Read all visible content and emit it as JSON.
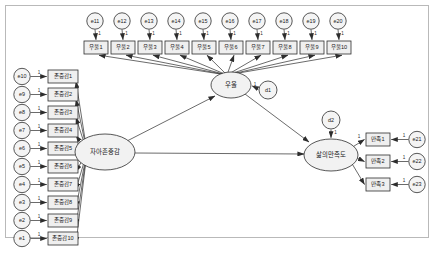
{
  "diagram": {
    "caption": "",
    "colors": {
      "frame_border": "#b9b9b9",
      "node_fill": "#f1f1f1",
      "node_stroke": "#2d2d2d",
      "edge": "#3a3a3a",
      "background": "#ffffff"
    },
    "latents": [
      {
        "id": "self_esteem",
        "label": "자아존중감",
        "cx": 105,
        "cy": 152,
        "rx": 30,
        "ry": 18
      },
      {
        "id": "depression",
        "label": "우울",
        "cx": 231,
        "cy": 85,
        "rx": 20,
        "ry": 13
      },
      {
        "id": "life_satis",
        "label": "삶의만족도",
        "cx": 331,
        "cy": 155,
        "rx": 27,
        "ry": 16
      }
    ],
    "disturbances": [
      {
        "id": "d1",
        "label": "d1",
        "cx": 268,
        "cy": 90,
        "r": 9
      },
      {
        "id": "d2",
        "label": "d2",
        "cx": 331,
        "cy": 120,
        "r": 9
      }
    ],
    "depression_indicators": {
      "boxes": [
        {
          "label": "우울1",
          "x": 84,
          "y": 41
        },
        {
          "label": "우울2",
          "x": 111,
          "y": 41
        },
        {
          "label": "우울3",
          "x": 138,
          "y": 41
        },
        {
          "label": "우울4",
          "x": 165,
          "y": 41
        },
        {
          "label": "우울5",
          "x": 192,
          "y": 41
        },
        {
          "label": "우울6",
          "x": 219,
          "y": 41
        },
        {
          "label": "우울7",
          "x": 246,
          "y": 41
        },
        {
          "label": "우울8",
          "x": 273,
          "y": 41
        },
        {
          "label": "우울9",
          "x": 300,
          "y": 41
        },
        {
          "label": "우울10",
          "x": 327,
          "y": 41
        }
      ],
      "errors": [
        {
          "label": "e11",
          "cx": 95,
          "cy": 21
        },
        {
          "label": "e12",
          "cx": 122,
          "cy": 21
        },
        {
          "label": "e13",
          "cx": 149,
          "cy": 21
        },
        {
          "label": "e14",
          "cx": 176,
          "cy": 21
        },
        {
          "label": "e15",
          "cx": 203,
          "cy": 21
        },
        {
          "label": "e16",
          "cx": 230,
          "cy": 21
        },
        {
          "label": "e17",
          "cx": 257,
          "cy": 21
        },
        {
          "label": "e18",
          "cx": 284,
          "cy": 21
        },
        {
          "label": "e19",
          "cx": 311,
          "cy": 21
        },
        {
          "label": "e20",
          "cx": 338,
          "cy": 21
        }
      ]
    },
    "esteem_indicators": {
      "boxes": [
        {
          "label": "존중감1",
          "y": 70
        },
        {
          "label": "존중감2",
          "y": 88
        },
        {
          "label": "존중감3",
          "y": 106
        },
        {
          "label": "존중감4",
          "y": 124
        },
        {
          "label": "존중감5",
          "y": 142
        },
        {
          "label": "존중감6",
          "y": 160
        },
        {
          "label": "존중감7",
          "y": 178
        },
        {
          "label": "존중감8",
          "y": 196
        },
        {
          "label": "존중감9",
          "y": 214
        },
        {
          "label": "존중감10",
          "y": 232
        }
      ],
      "errors": [
        {
          "label": "e10",
          "cy": 70
        },
        {
          "label": "e9",
          "cy": 88
        },
        {
          "label": "e8",
          "cy": 106
        },
        {
          "label": "e7",
          "cy": 124
        },
        {
          "label": "e6",
          "cy": 142
        },
        {
          "label": "e5",
          "cy": 160
        },
        {
          "label": "e4",
          "cy": 178
        },
        {
          "label": "e3",
          "cy": 196
        },
        {
          "label": "e2",
          "cy": 214
        },
        {
          "label": "e1",
          "cy": 232
        }
      ]
    },
    "satisfaction_indicators": {
      "boxes": [
        {
          "label": "만족1",
          "y": 133
        },
        {
          "label": "만족2",
          "y": 155
        },
        {
          "label": "만족3",
          "y": 178
        }
      ],
      "errors": [
        {
          "label": "e21",
          "cy": 133
        },
        {
          "label": "e22",
          "cy": 155
        },
        {
          "label": "e23",
          "cy": 178
        }
      ]
    },
    "fixed_coefficients": {
      "error_loading": "1",
      "first_loading": "1",
      "disturbance_loading": "1"
    }
  }
}
